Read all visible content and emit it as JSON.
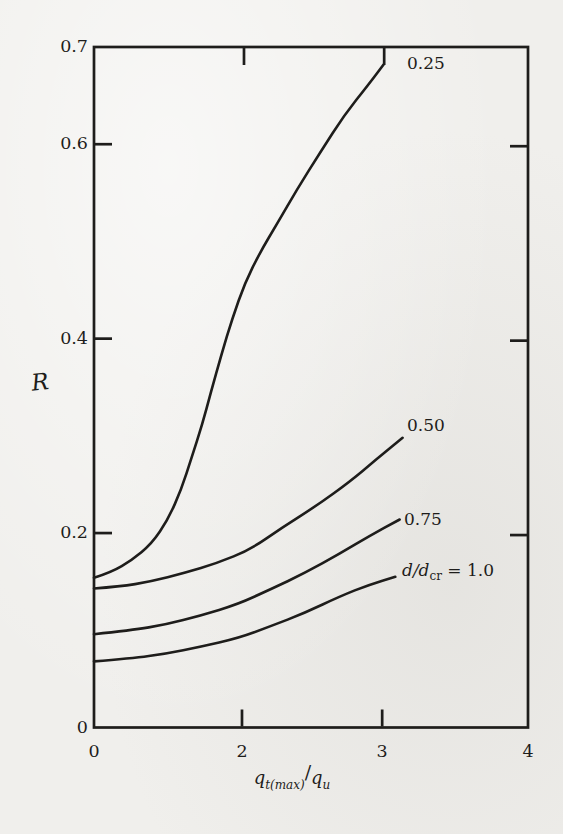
{
  "page": {
    "background": "#f0efec",
    "ink_color": "#1e1d1b"
  },
  "chart_data": {
    "type": "line",
    "title": "",
    "ylabel": "R",
    "xlabel_parts": {
      "q1": "q",
      "sub1": "t(max)",
      "slash": "/",
      "q2": "q",
      "sub2": "u"
    },
    "xlim": [
      0,
      4
    ],
    "ylim": [
      0,
      0.7
    ],
    "grid": false,
    "legend_position": "inline-right-of-curve-ends",
    "x_axis": {
      "ticks": [
        {
          "value": "0",
          "frac": 0.0,
          "tick_mark": false
        },
        {
          "value": "2",
          "frac": 0.341,
          "tick_mark": true
        },
        {
          "value": "3",
          "frac": 0.664,
          "tick_mark": true
        },
        {
          "value": "4",
          "frac": 1.0,
          "tick_mark": false
        }
      ]
    },
    "y_axis": {
      "ticks": [
        {
          "value": "0",
          "r": 0.0,
          "tick_mark": false
        },
        {
          "value": "0.2",
          "r": 0.2,
          "tick_mark": true
        },
        {
          "value": "0.4",
          "r": 0.4,
          "tick_mark": true
        },
        {
          "value": "0.6",
          "r": 0.6,
          "tick_mark": true
        },
        {
          "value": "0.7",
          "r": 0.7,
          "tick_mark": false
        }
      ]
    },
    "series": [
      {
        "name": "d/dcr = 0.25",
        "label": "0.25",
        "points": [
          [
            0,
            0.154
          ],
          [
            0.24,
            0.16
          ],
          [
            0.51,
            0.172
          ],
          [
            0.78,
            0.189
          ],
          [
            1.0,
            0.214
          ],
          [
            1.18,
            0.245
          ],
          [
            1.32,
            0.278
          ],
          [
            1.46,
            0.311
          ],
          [
            1.58,
            0.345
          ],
          [
            1.72,
            0.383
          ],
          [
            1.87,
            0.421
          ],
          [
            2.02,
            0.457
          ],
          [
            2.13,
            0.489
          ],
          [
            2.25,
            0.518
          ],
          [
            2.39,
            0.553
          ],
          [
            2.56,
            0.592
          ],
          [
            2.73,
            0.63
          ],
          [
            2.9,
            0.661
          ],
          [
            3.01,
            0.682
          ]
        ]
      },
      {
        "name": "d/dcr = 0.50",
        "label": "0.50",
        "points": [
          [
            0,
            0.143
          ],
          [
            0.35,
            0.145
          ],
          [
            0.76,
            0.15
          ],
          [
            1.23,
            0.159
          ],
          [
            1.66,
            0.169
          ],
          [
            2.06,
            0.183
          ],
          [
            2.29,
            0.206
          ],
          [
            2.54,
            0.229
          ],
          [
            2.77,
            0.253
          ],
          [
            2.95,
            0.275
          ],
          [
            3.14,
            0.298
          ]
        ]
      },
      {
        "name": "d/dcr = 0.75",
        "label": "0.75",
        "points": [
          [
            0,
            0.096
          ],
          [
            0.5,
            0.1
          ],
          [
            0.98,
            0.106
          ],
          [
            1.43,
            0.115
          ],
          [
            1.95,
            0.127
          ],
          [
            2.2,
            0.142
          ],
          [
            2.45,
            0.159
          ],
          [
            2.7,
            0.179
          ],
          [
            2.91,
            0.197
          ],
          [
            3.12,
            0.214
          ]
        ]
      },
      {
        "name": "d/dcr = 1.0",
        "label_main": "d/d",
        "label_sub": "cr",
        "label_eq": " = 1.0",
        "points": [
          [
            0,
            0.068
          ],
          [
            0.5,
            0.071
          ],
          [
            0.98,
            0.076
          ],
          [
            1.43,
            0.083
          ],
          [
            1.95,
            0.092
          ],
          [
            2.2,
            0.104
          ],
          [
            2.45,
            0.118
          ],
          [
            2.7,
            0.135
          ],
          [
            2.91,
            0.147
          ],
          [
            3.09,
            0.155
          ]
        ]
      }
    ],
    "line_color": "#1e1d1b"
  }
}
